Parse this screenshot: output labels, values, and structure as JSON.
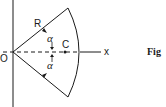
{
  "diagram": {
    "type": "circular-sector",
    "labels": {
      "origin": "O",
      "radius": "R",
      "centroid": "C",
      "x_axis": "x",
      "half_angle_top": "α",
      "half_angle_bottom": "α",
      "figure_caption": "Fig"
    },
    "colors": {
      "stroke": "#1a1a1a",
      "background": "#ffffff"
    }
  }
}
